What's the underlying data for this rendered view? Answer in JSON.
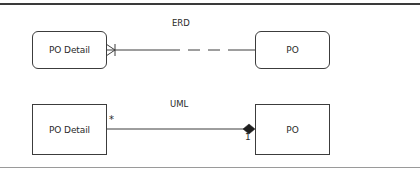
{
  "diagrams": {
    "erd": {
      "title": "ERD",
      "left_entity": "PO Detail",
      "right_entity": "PO",
      "left_end": "crows-foot-many",
      "line_style": "solid-then-dashed"
    },
    "uml": {
      "title": "UML",
      "left_class": "PO Detail",
      "right_class": "PO",
      "left_multiplicity": "*",
      "right_multiplicity": "1",
      "right_end": "composition-diamond"
    }
  },
  "colors": {
    "stroke": "#3c3c3c",
    "top_rule": "#3a3a3a",
    "bottom_rule": "#9a9a9a"
  }
}
